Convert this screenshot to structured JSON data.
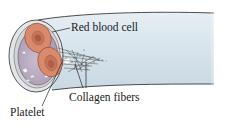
{
  "diagram": {
    "labels": {
      "red_blood_cell": "Red blood cell",
      "collagen_fibers": "Collagen fibers",
      "platelet": "Platelet"
    },
    "colors": {
      "vessel_fill": "#dbe6ee",
      "vessel_outline": "#3a3a3a",
      "lumen_fill": "#bdaec4",
      "rbc_fill": "#d9886a",
      "rbc_center": "#c46e52",
      "fibers": "#333333"
    }
  }
}
